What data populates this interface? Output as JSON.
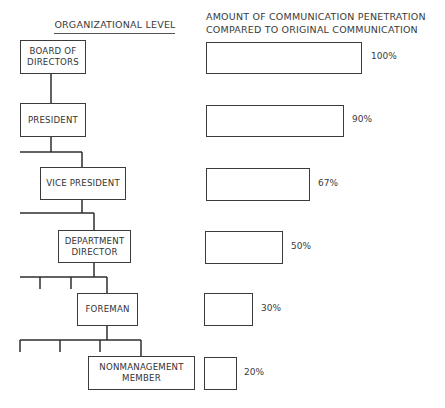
{
  "headers": {
    "left": "ORGANIZATIONAL LEVEL",
    "right_line1": "AMOUNT OF COMMUNICATION PENETRATION",
    "right_line2": "COMPARED TO ORIGINAL COMMUNICATION"
  },
  "levels": [
    {
      "name": "BOARD OF\nDIRECTORS",
      "penetration": "100%",
      "value": 100
    },
    {
      "name": "PRESIDENT",
      "penetration": "90%",
      "value": 90
    },
    {
      "name": "VICE PRESIDENT",
      "penetration": "67%",
      "value": 67
    },
    {
      "name": "DEPARTMENT\nDIRECTOR",
      "penetration": "50%",
      "value": 50
    },
    {
      "name": "FOREMAN",
      "penetration": "30%",
      "value": 30
    },
    {
      "name": "NONMANAGEMENT\nMEMBER",
      "penetration": "20%",
      "value": 20
    }
  ],
  "colors": {
    "line": "#2e2e2e",
    "text": "#333333",
    "background": "#ffffff"
  }
}
